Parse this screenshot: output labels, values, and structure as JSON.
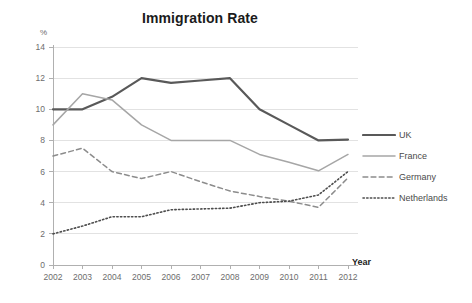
{
  "chart_data": {
    "type": "line",
    "title": "Immigration Rate",
    "xlabel": "Year",
    "ylabel": "%",
    "ylim": [
      0,
      14
    ],
    "ytick_step": 2,
    "yticks": [
      "0",
      "2",
      "4",
      "6",
      "8",
      "10",
      "12",
      "14"
    ],
    "grid": true,
    "grid_axis": "y",
    "legend_position": "right",
    "categories": [
      "2002",
      "2003",
      "2004",
      "2005",
      "2006",
      "2007",
      "2008",
      "2009",
      "2010",
      "2011",
      "2012"
    ],
    "x": [
      2002,
      2003,
      2004,
      2005,
      2006,
      2007,
      2008,
      2009,
      2010,
      2011,
      2012
    ],
    "series": [
      {
        "name": "UK",
        "style": "solid",
        "color": "#595959",
        "width": 2.2,
        "values": [
          10.0,
          10.0,
          10.8,
          12.0,
          11.7,
          11.85,
          12.0,
          10.0,
          9.0,
          8.0,
          8.05
        ]
      },
      {
        "name": "France",
        "style": "solid",
        "color": "#a6a6a6",
        "width": 1.5,
        "values": [
          9.0,
          11.0,
          10.6,
          9.0,
          8.0,
          8.0,
          8.0,
          7.1,
          6.6,
          6.05,
          7.1
        ]
      },
      {
        "name": "Germany",
        "style": "dashed",
        "color": "#8c8c8c",
        "width": 1.5,
        "values": [
          7.0,
          7.5,
          6.0,
          5.55,
          6.0,
          5.35,
          4.75,
          4.4,
          4.1,
          3.7,
          5.6
        ]
      },
      {
        "name": "Netherlands",
        "style": "dotted",
        "color": "#4d4d4d",
        "width": 1.6,
        "values": [
          2.0,
          2.5,
          3.1,
          3.1,
          3.55,
          3.6,
          3.65,
          4.0,
          4.1,
          4.5,
          6.0
        ]
      }
    ]
  },
  "legend": {
    "items": [
      {
        "label": "UK"
      },
      {
        "label": "France"
      },
      {
        "label": "Germany"
      },
      {
        "label": "Netherlands"
      }
    ]
  },
  "colors": {
    "background": "#ffffff",
    "axis": "#b0b0b0",
    "grid": "#e2e2e2",
    "title": "#1b1b1b",
    "tick_text": "#6d6d6d"
  }
}
